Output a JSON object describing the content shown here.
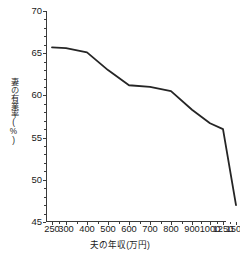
{
  "chart_data": {
    "type": "line",
    "title": "",
    "xlabel": "夫の年収(万円)",
    "ylabel": "妻の有業率(%)",
    "categories": [
      "250",
      "300",
      "400",
      "500",
      "600",
      "700",
      "800",
      "900",
      "1000",
      "1250",
      "1500"
    ],
    "x_tick_labels": [
      "250",
      "300",
      "400",
      "500",
      "600",
      "700",
      "800",
      "900",
      "1000",
      "1250",
      "1500"
    ],
    "y_tick_labels": [
      "45",
      "50",
      "55",
      "60",
      "65",
      "70"
    ],
    "y_ticks": [
      45,
      50,
      55,
      60,
      65,
      70
    ],
    "ylim": [
      45,
      70
    ],
    "grid": false,
    "legend": "none",
    "series": [
      {
        "name": "妻の有業率",
        "color": "#252525",
        "values": [
          65.7,
          65.6,
          65.1,
          63.0,
          61.2,
          61.0,
          60.5,
          58.3,
          56.7,
          56.0,
          47.0
        ]
      }
    ]
  },
  "axes": {
    "y_title": "妻の有業率(%)",
    "x_title": "夫の年収(万円)"
  }
}
